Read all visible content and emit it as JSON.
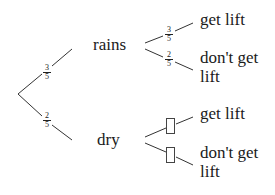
{
  "diagram": {
    "type": "probability-tree",
    "first_level": {
      "branches": [
        {
          "label": "rains",
          "probability": {
            "numerator": "3",
            "denominator": "5"
          }
        },
        {
          "label": "dry",
          "probability": {
            "numerator": "2",
            "denominator": "5"
          }
        }
      ]
    },
    "second_level": {
      "rains": {
        "branches": [
          {
            "label": "get lift",
            "probability": {
              "numerator": "3",
              "denominator": "5"
            }
          },
          {
            "label_line1": "don't get",
            "label_line2": "lift",
            "probability": {
              "numerator": "2",
              "denominator": "5"
            }
          }
        ]
      },
      "dry": {
        "branches": [
          {
            "label": "get lift",
            "probability": "blank"
          },
          {
            "label_line1": "don't get",
            "label_line2": "lift",
            "probability": "blank"
          }
        ]
      }
    }
  }
}
